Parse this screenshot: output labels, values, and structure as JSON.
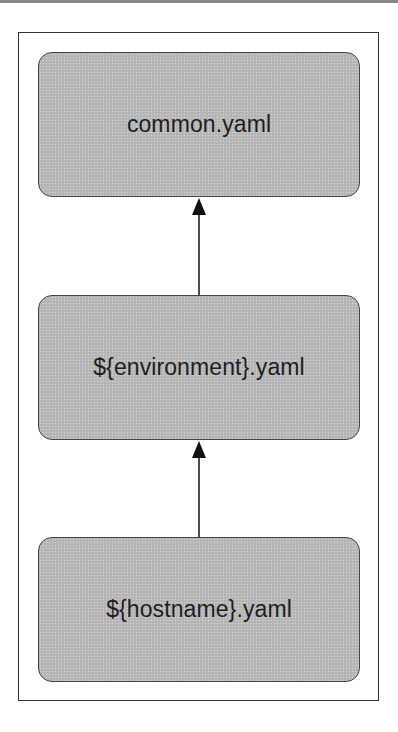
{
  "diagram": {
    "type": "hierarchy-flow",
    "nodes": [
      {
        "id": "common",
        "label": "common.yaml"
      },
      {
        "id": "environment",
        "label": "${environment}.yaml"
      },
      {
        "id": "hostname",
        "label": "${hostname}.yaml"
      }
    ],
    "edges": [
      {
        "from": "environment",
        "to": "common",
        "style": "arrow-up"
      },
      {
        "from": "hostname",
        "to": "environment",
        "style": "arrow-up"
      }
    ],
    "colors": {
      "node_fill": "#b9b9b9",
      "node_border": "#444444",
      "frame_border": "#333333",
      "arrow": "#111111"
    }
  }
}
